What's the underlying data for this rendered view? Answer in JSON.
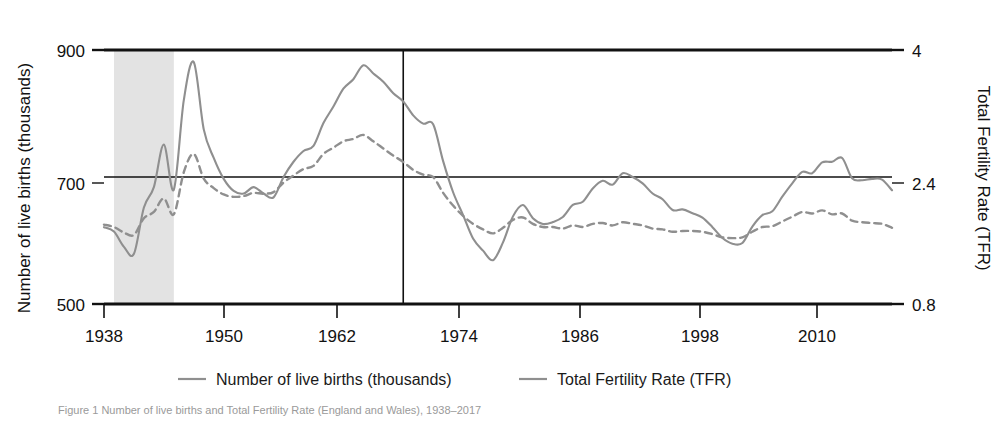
{
  "figure": {
    "caption": "Figure 1  Number of live births and Total Fertility Rate (England and Wales), 1938–2017",
    "background_color": "#ffffff",
    "series_color": "#8f8f8f",
    "axis_color": "#111111",
    "war_band_color": "#e3e3e3"
  },
  "chart_data": {
    "type": "line",
    "title": "",
    "xlabel": "",
    "ylabel": "Number of live births (thousands)",
    "y2label": "Total Fertility Rate (TFR)",
    "xlim": [
      1938,
      2017
    ],
    "ylim": [
      500,
      900
    ],
    "y2lim": [
      0.8,
      4.0
    ],
    "grid": false,
    "gridlines_drawn": [
      "y=700 / TFR=2.4"
    ],
    "xticks": [
      1938,
      1950,
      1962,
      1974,
      1986,
      1998,
      2010
    ],
    "xticklabels": [
      "1938",
      "1950",
      "1962",
      "1974",
      "1986",
      "1998",
      "2010"
    ],
    "yticks": [
      500,
      700,
      900
    ],
    "yticklabels": [
      "500",
      "700",
      "900"
    ],
    "y2ticks": [
      0.8,
      2.4,
      4.0
    ],
    "y2ticklabels": [
      "0.8",
      "2.4",
      "4"
    ],
    "legend_position": "below-axes",
    "annotations": [
      {
        "type": "vspan",
        "label": "Second World War",
        "x0": 1939,
        "x1": 1945,
        "color": "#e3e3e3"
      },
      {
        "type": "vline",
        "label": "1968 reference line",
        "x": 1968,
        "color": "#111111"
      },
      {
        "type": "hline",
        "label": "700 thousand / TFR 2.4 reference line",
        "y": 700,
        "color": "#111111"
      }
    ],
    "x": [
      1938,
      1939,
      1940,
      1941,
      1942,
      1943,
      1944,
      1945,
      1946,
      1947,
      1948,
      1949,
      1950,
      1951,
      1952,
      1953,
      1954,
      1955,
      1956,
      1957,
      1958,
      1959,
      1960,
      1961,
      1962,
      1963,
      1964,
      1965,
      1966,
      1967,
      1968,
      1969,
      1970,
      1971,
      1972,
      1973,
      1974,
      1975,
      1976,
      1977,
      1978,
      1979,
      1980,
      1981,
      1982,
      1983,
      1984,
      1985,
      1986,
      1987,
      1988,
      1989,
      1990,
      1991,
      1992,
      1993,
      1994,
      1995,
      1996,
      1997,
      1998,
      1999,
      2000,
      2001,
      2002,
      2003,
      2004,
      2005,
      2006,
      2007,
      2008,
      2009,
      2010,
      2011,
      2012,
      2013,
      2014,
      2015,
      2016,
      2017
    ],
    "series": [
      {
        "name": "Number of live births (thousands)",
        "style": "solid",
        "color": "#8f8f8f",
        "axis": "left",
        "values": [
          621,
          614,
          590,
          579,
          652,
          684,
          751,
          680,
          821,
          881,
          775,
          730,
          697,
          678,
          674,
          684,
          674,
          668,
          700,
          724,
          741,
          749,
          785,
          811,
          839,
          854,
          876,
          863,
          850,
          832,
          819,
          797,
          784,
          783,
          725,
          676,
          640,
          603,
          584,
          569,
          597,
          638,
          656,
          635,
          626,
          629,
          637,
          656,
          661,
          682,
          694,
          688,
          706,
          700,
          690,
          674,
          665,
          648,
          649,
          643,
          636,
          621,
          604,
          595,
          596,
          622,
          640,
          646,
          669,
          690,
          708,
          706,
          723,
          724,
          730,
          698,
          695,
          697,
          696,
          679
        ]
      },
      {
        "name": "Total Fertility Rate (TFR)",
        "style": "dashed",
        "color": "#8f8f8f",
        "axis": "right",
        "values": [
          1.8,
          1.77,
          1.7,
          1.67,
          1.88,
          1.96,
          2.13,
          1.93,
          2.46,
          2.69,
          2.38,
          2.26,
          2.18,
          2.15,
          2.16,
          2.2,
          2.19,
          2.21,
          2.33,
          2.42,
          2.5,
          2.54,
          2.69,
          2.77,
          2.85,
          2.88,
          2.93,
          2.85,
          2.76,
          2.67,
          2.59,
          2.49,
          2.43,
          2.4,
          2.2,
          2.04,
          1.91,
          1.81,
          1.74,
          1.69,
          1.76,
          1.86,
          1.89,
          1.81,
          1.77,
          1.77,
          1.75,
          1.79,
          1.77,
          1.81,
          1.82,
          1.79,
          1.83,
          1.81,
          1.79,
          1.75,
          1.74,
          1.71,
          1.72,
          1.72,
          1.71,
          1.68,
          1.64,
          1.63,
          1.64,
          1.71,
          1.77,
          1.78,
          1.84,
          1.9,
          1.96,
          1.94,
          1.98,
          1.93,
          1.94,
          1.85,
          1.83,
          1.82,
          1.81,
          1.76
        ]
      }
    ]
  },
  "left_axis": {
    "title": "Number of live births (thousands)",
    "ticks": [
      {
        "value": "900",
        "y": 50
      },
      {
        "value": "700",
        "y": 183
      },
      {
        "value": "500",
        "y": 304
      }
    ]
  },
  "right_axis": {
    "title": "Total Fertility Rate (TFR)",
    "ticks": [
      {
        "value": "4",
        "y": 50
      },
      {
        "value": "2.4",
        "y": 183
      },
      {
        "value": "0.8",
        "y": 304
      }
    ]
  },
  "x_axis": {
    "ticks": [
      {
        "label": "1938",
        "x": 104
      },
      {
        "label": "1950",
        "x": 224
      },
      {
        "label": "1962",
        "x": 337
      },
      {
        "label": "1974",
        "x": 459
      },
      {
        "label": "1986",
        "x": 580
      },
      {
        "label": "1998",
        "x": 700
      },
      {
        "label": "2010",
        "x": 817
      }
    ]
  },
  "legend": {
    "items": [
      {
        "label": "Number of live births (thousands)",
        "style": "solid",
        "color": "#8f8f8f"
      },
      {
        "label": "Total Fertility Rate (TFR)",
        "style": "solid",
        "color": "#8f8f8f"
      }
    ]
  }
}
